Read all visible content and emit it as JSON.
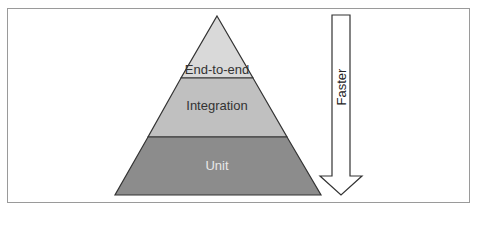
{
  "diagram": {
    "layers": [
      {
        "label": "End-to-end",
        "color": "#d9d9d9",
        "position": "top"
      },
      {
        "label": "Integration",
        "color": "#c0c0c0",
        "position": "middle"
      },
      {
        "label": "Unit",
        "color": "#8c8c8c",
        "position": "bottom"
      }
    ],
    "arrow": {
      "label": "Faster",
      "direction": "down"
    },
    "colors": {
      "outline": "#333333",
      "frame": "#9a9a9a"
    }
  }
}
